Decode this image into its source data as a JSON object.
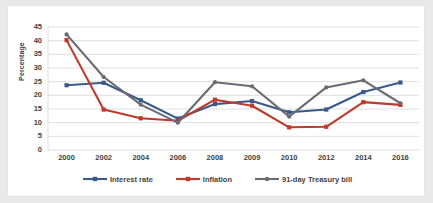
{
  "chart_data": {
    "type": "line",
    "title": "",
    "subtitle": "",
    "xlabel": "",
    "ylabel": "Percentage",
    "categories": [
      "2000",
      "2002",
      "2004",
      "2006",
      "2008",
      "2009",
      "2010",
      "2012",
      "2014",
      "2016"
    ],
    "ylim": [
      0,
      45
    ],
    "ytick_step": 5,
    "yticks": [
      "0",
      "5",
      "10",
      "15",
      "20",
      "25",
      "30",
      "35",
      "40",
      "45"
    ],
    "grid": "horizontal",
    "legend_position": "bottom",
    "series": [
      {
        "name": "Interest rate",
        "color": "#3a5a8c",
        "marker": "square",
        "values": [
          23.7,
          24.6,
          18.2,
          11.5,
          16.8,
          17.9,
          13.8,
          14.8,
          21.2,
          24.7
        ]
      },
      {
        "name": "Inflation",
        "color": "#c0392b",
        "marker": "square",
        "values": [
          40.2,
          14.8,
          11.6,
          10.7,
          18.4,
          16.2,
          8.3,
          8.5,
          17.5,
          16.5
        ]
      },
      {
        "name": "91-day Treasury bill",
        "color": "#6b6b73",
        "marker": "circle",
        "values": [
          42.3,
          26.7,
          16.6,
          10.0,
          24.8,
          23.3,
          12.2,
          22.9,
          25.5,
          17.1
        ]
      }
    ]
  },
  "colors": {
    "background": "#e9e9e9",
    "plot_background": "#ffffff",
    "gridline": "#dfdfe2",
    "axis_text": "#3f3f3f",
    "frame_border": "#e3e3e3"
  }
}
